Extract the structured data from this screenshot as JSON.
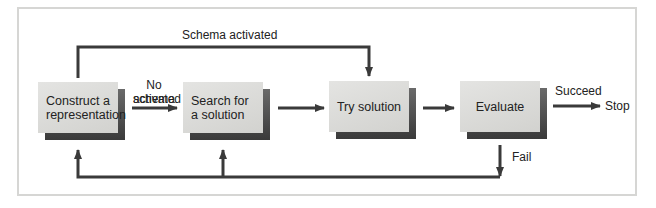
{
  "diagram": {
    "nodes": [
      {
        "id": "construct",
        "label": "Construct a representation"
      },
      {
        "id": "search",
        "label": "Search for a solution"
      },
      {
        "id": "try",
        "label": "Try solution"
      },
      {
        "id": "evaluate",
        "label": "Evaluate"
      }
    ],
    "edge_labels": {
      "schema_activated": "Schema activated",
      "no_schema_activated_line1": "No schema",
      "no_schema_activated_line2": "activated",
      "succeed": "Succeed",
      "stop": "Stop",
      "fail": "Fail"
    },
    "edges": [
      {
        "from": "construct",
        "to": "search",
        "label": "No schema activated"
      },
      {
        "from": "construct",
        "to": "try",
        "label": "Schema activated"
      },
      {
        "from": "search",
        "to": "try",
        "label": ""
      },
      {
        "from": "try",
        "to": "evaluate",
        "label": ""
      },
      {
        "from": "evaluate",
        "to": "stop",
        "label": "Succeed"
      },
      {
        "from": "evaluate",
        "to": "construct",
        "label": "Fail"
      },
      {
        "from": "evaluate",
        "to": "search",
        "label": "Fail"
      }
    ],
    "colors": {
      "arrow": "#3a3a3a",
      "box": "#dcdcda",
      "shadow": "#4a4a4a",
      "frame": "#d6d6d4"
    }
  }
}
